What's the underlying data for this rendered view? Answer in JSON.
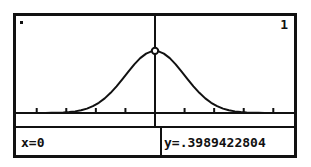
{
  "device": {
    "screen_type": "graphing-calculator-lcd",
    "foreground_color": "#111111",
    "background_color": "#ffffff"
  },
  "screen": {
    "plot_indicator_dot": "·",
    "function_number": "1"
  },
  "status_bar": {
    "x_readout": "x=0",
    "y_readout": "y=.3989422804"
  },
  "chart_data": {
    "type": "line",
    "title": "",
    "subtitle": "",
    "xlabel": "",
    "ylabel": "",
    "grid": false,
    "legend": [],
    "axis": {
      "x_axis_visible": true,
      "y_axis_visible": false,
      "x_tick_count": 10,
      "x_tick_spacing_units": 1,
      "xlim": [
        -4.7,
        4.7
      ],
      "ylim": [
        0,
        0.52
      ]
    },
    "annotations": [
      {
        "name": "trace-cursor",
        "x": 0,
        "y": 0.3989422804,
        "label": "x=0  y=.3989422804",
        "marker": "circle"
      },
      {
        "name": "trace-vertical-line",
        "x": 0
      }
    ],
    "series": [
      {
        "name": "normalpdf(x)",
        "type": "line",
        "color": "#111111",
        "x": [
          -4.7,
          -4.5,
          -4.3,
          -4.1,
          -3.9,
          -3.7,
          -3.5,
          -3.3,
          -3.1,
          -2.9,
          -2.7,
          -2.5,
          -2.3,
          -2.1,
          -1.9,
          -1.7,
          -1.5,
          -1.3,
          -1.1,
          -0.9,
          -0.7,
          -0.5,
          -0.3,
          -0.1,
          0,
          0.1,
          0.3,
          0.5,
          0.7,
          0.9,
          1.1,
          1.3,
          1.5,
          1.7,
          1.9,
          2.1,
          2.3,
          2.5,
          2.7,
          2.9,
          3.1,
          3.3,
          3.5,
          3.7,
          3.9,
          4.1,
          4.3,
          4.5,
          4.7
        ],
        "y": [
          0.0,
          0.0,
          0.0,
          0.0001,
          0.0002,
          0.0004,
          0.0009,
          0.0017,
          0.0033,
          0.006,
          0.0104,
          0.0175,
          0.0283,
          0.044,
          0.0656,
          0.094,
          0.1295,
          0.1714,
          0.2179,
          0.2661,
          0.3123,
          0.3521,
          0.3814,
          0.397,
          0.3989,
          0.397,
          0.3814,
          0.3521,
          0.3123,
          0.2661,
          0.2179,
          0.1714,
          0.1295,
          0.094,
          0.0656,
          0.044,
          0.0283,
          0.0175,
          0.0104,
          0.006,
          0.0033,
          0.0017,
          0.0009,
          0.0004,
          0.0002,
          0.0001,
          0.0,
          0.0,
          0.0
        ]
      }
    ]
  }
}
